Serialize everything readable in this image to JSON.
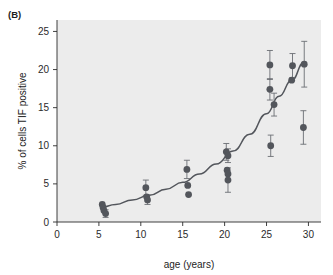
{
  "figure": {
    "panel_label": "(B)",
    "background_color": "#ffffff",
    "plot_background_color": "#ececec",
    "marker_color": "#53565c",
    "curve_color": "#53565c",
    "axis_color": "#2b2b2b"
  },
  "chart_data": {
    "type": "scatter",
    "title": "",
    "xlabel": "age (years)",
    "ylabel": "% of cells TIF positive",
    "xlim": [
      0,
      31.5
    ],
    "ylim": [
      0,
      26.5
    ],
    "xticks": [
      0,
      5,
      10,
      15,
      20,
      25,
      30
    ],
    "xtick_labels": [
      "0",
      "5",
      "10",
      "15",
      "20",
      "25",
      "30"
    ],
    "yticks": [
      0,
      5,
      10,
      15,
      20,
      25
    ],
    "ytick_labels": [
      "0",
      "5",
      "10",
      "15",
      "20",
      "25"
    ],
    "grid": false,
    "legend": "none",
    "points": [
      {
        "x": 5.4,
        "y": 2.3,
        "yerr": 0.0
      },
      {
        "x": 5.5,
        "y": 1.9,
        "yerr": 0.0
      },
      {
        "x": 5.6,
        "y": 1.5,
        "yerr": 0.0
      },
      {
        "x": 5.8,
        "y": 1.1,
        "yerr": 0.5
      },
      {
        "x": 10.6,
        "y": 4.5,
        "yerr": 1.0
      },
      {
        "x": 10.7,
        "y": 3.3,
        "yerr": 0.0
      },
      {
        "x": 10.8,
        "y": 2.9,
        "yerr": 0.6
      },
      {
        "x": 15.5,
        "y": 6.9,
        "yerr": 1.2
      },
      {
        "x": 15.6,
        "y": 4.8,
        "yerr": 0.0
      },
      {
        "x": 15.7,
        "y": 3.6,
        "yerr": 0.0
      },
      {
        "x": 20.2,
        "y": 9.2,
        "yerr": 1.1
      },
      {
        "x": 20.4,
        "y": 8.7,
        "yerr": 0.9
      },
      {
        "x": 20.3,
        "y": 6.8,
        "yerr": 0.0
      },
      {
        "x": 20.4,
        "y": 6.3,
        "yerr": 0.0
      },
      {
        "x": 20.4,
        "y": 5.5,
        "yerr": 1.6
      },
      {
        "x": 25.4,
        "y": 20.6,
        "yerr": 1.9
      },
      {
        "x": 25.4,
        "y": 17.4,
        "yerr": 1.4
      },
      {
        "x": 25.9,
        "y": 15.4,
        "yerr": 1.5
      },
      {
        "x": 25.5,
        "y": 10.0,
        "yerr": 1.4
      },
      {
        "x": 28.1,
        "y": 20.5,
        "yerr": 1.6
      },
      {
        "x": 28.0,
        "y": 18.6,
        "yerr": 0.0
      },
      {
        "x": 29.5,
        "y": 20.7,
        "yerr": 3.0
      },
      {
        "x": 29.4,
        "y": 12.4,
        "yerr": 2.2
      }
    ],
    "fit_curve": {
      "description": "exponential trend line",
      "x": [
        5.2,
        7,
        9,
        11,
        13,
        15,
        17,
        19,
        21,
        23,
        25,
        26.5,
        28,
        29.5
      ],
      "y": [
        1.9,
        2.3,
        2.9,
        3.5,
        4.3,
        5.2,
        6.3,
        7.6,
        9.3,
        11.5,
        14.2,
        16.5,
        18.6,
        21.0
      ]
    }
  }
}
